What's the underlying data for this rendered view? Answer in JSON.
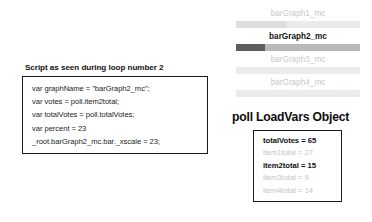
{
  "script_panel": {
    "title": "Script as seen during loop number 2",
    "code_lines": [
      "var graphName = \"barGraph2_mc\";",
      "var votes = poll.item2total;",
      "var totalVotes = poll.totalVotes;",
      "var percent = 23",
      "_root.barGraph2_mc.bar._xscale = 23;"
    ]
  },
  "bargraph_panel": {
    "bars": [
      {
        "label": "barGraph1_mc",
        "fill_percent": 41,
        "active": false
      },
      {
        "label": "barGraph2_mc",
        "fill_percent": 23,
        "active": true
      },
      {
        "label": "barGraph3_mc",
        "fill_percent": 0,
        "active": false
      },
      {
        "label": "barGraph4_mc",
        "fill_percent": 0,
        "active": false
      }
    ]
  },
  "loadvars_panel": {
    "title": "poll LoadVars Object",
    "vars": [
      {
        "text": "totalVotes = 65",
        "active": true
      },
      {
        "text": "item1total = 27",
        "active": false
      },
      {
        "text": "item2total = 15",
        "active": true
      },
      {
        "text": "item3total = 9",
        "active": false
      },
      {
        "text": "item4total = 14",
        "active": false
      }
    ]
  },
  "colors": {
    "border": "#1a1a1a",
    "active_text": "#111111",
    "inactive_text": "#c4c4c4",
    "bar_track": "#eceaea",
    "bar_track_active": "#b9b9b9",
    "bar_fill": "#dedede",
    "bar_fill_active": "#5d5d5d"
  }
}
